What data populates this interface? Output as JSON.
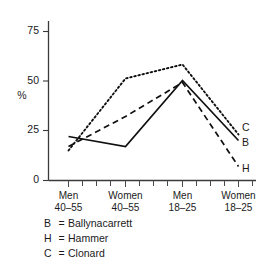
{
  "chart_data": {
    "type": "line",
    "title": "",
    "xlabel": "",
    "ylabel": "%",
    "ylim": [
      0,
      85
    ],
    "yticks": [
      0,
      25,
      50,
      75
    ],
    "ytick_labels": [
      "0",
      "25",
      "50",
      "75"
    ],
    "grid": false,
    "legend_position": "below-plot",
    "categories": [
      "Men 40–55",
      "Women 40–55",
      "Men 18–25",
      "Women 18–25"
    ],
    "category_lines": [
      {
        "top": "Men",
        "bottom": "40–55"
      },
      {
        "top": "Women",
        "bottom": "40–55"
      },
      {
        "top": "Men",
        "bottom": "18–25"
      },
      {
        "top": "Women",
        "bottom": "18–25"
      }
    ],
    "series": [
      {
        "name": "Ballynacarrett",
        "key": "B",
        "style": "solid",
        "values": [
          22,
          17,
          50,
          20
        ]
      },
      {
        "name": "Hammer",
        "key": "H",
        "style": "dashed",
        "values": [
          17,
          32,
          49,
          7
        ]
      },
      {
        "name": "Clonard",
        "key": "C",
        "style": "dotted",
        "values": [
          15,
          51,
          58,
          23
        ]
      }
    ],
    "endpoint_labels": [
      "C",
      "B",
      "H"
    ]
  },
  "legend": {
    "equals": "=",
    "rows": [
      {
        "key": "B",
        "name": "Ballynacarrett"
      },
      {
        "key": "H",
        "name": "Hammer"
      },
      {
        "key": "C",
        "name": "Clonard"
      }
    ]
  }
}
